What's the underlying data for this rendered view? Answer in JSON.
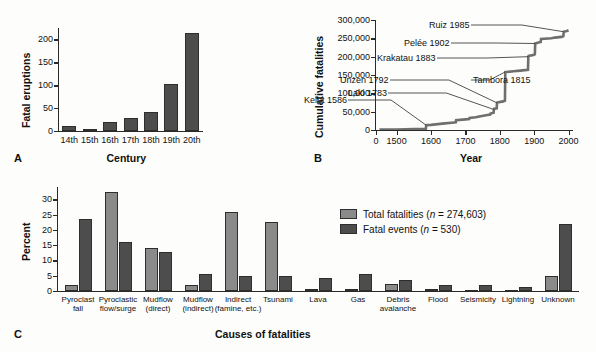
{
  "figure": {
    "panels": [
      {
        "letter": "A",
        "ylabel": "Fatal eruptions",
        "xlabel": "Century"
      },
      {
        "letter": "B",
        "ylabel": "Cumulative fatalities",
        "xlabel": "Year"
      },
      {
        "letter": "C",
        "ylabel": "Percent",
        "xlabel": "Causes of fatalities"
      }
    ]
  },
  "legend": {
    "items": [
      {
        "label_main": "Total fatalities (",
        "label_n": "n",
        "label_tail": " = 274,603)",
        "color": "#8a8a8a",
        "swatch": "light"
      },
      {
        "label_main": "Fatal events (",
        "label_n": "n",
        "label_tail": " = 530)",
        "color": "#4d4d4d",
        "swatch": "dark"
      }
    ]
  },
  "chart_data": [
    {
      "id": "panel-a",
      "type": "bar",
      "title": "",
      "xlabel": "Century",
      "ylabel": "Fatal eruptions",
      "categories": [
        "14th",
        "15th",
        "16th",
        "17th",
        "18th",
        "19th",
        "20th"
      ],
      "values": [
        11,
        5,
        19,
        29,
        41,
        102,
        213
      ],
      "yticks": [
        0,
        50,
        100,
        150,
        200
      ],
      "ylim": [
        0,
        225
      ],
      "grid": false,
      "legend": "none",
      "color": "#4d4d4d"
    },
    {
      "id": "panel-b",
      "type": "line",
      "title": "",
      "xlabel": "Year",
      "ylabel": "Cumulative fatalities",
      "yticks": [
        0,
        50000,
        100000,
        150000,
        200000,
        250000,
        300000
      ],
      "ytick_labels": [
        "0",
        "50,000",
        "100,000",
        "150,000",
        "200,000",
        "250,000",
        "300,000"
      ],
      "xticks": [
        0,
        1500,
        1600,
        1700,
        1800,
        1900,
        2000
      ],
      "xtick_labels": [
        "0",
        "1500",
        "1600",
        "1700",
        "1800",
        "1900",
        "2000"
      ],
      "xlim": [
        1440,
        2010
      ],
      "ylim": [
        0,
        300000
      ],
      "grid": false,
      "legend": "none",
      "series": [
        {
          "name": "Cumulative fatalities",
          "x": [
            1450,
            1500,
            1550,
            1585,
            1586,
            1600,
            1620,
            1640,
            1660,
            1672,
            1673,
            1700,
            1711,
            1712,
            1730,
            1740,
            1760,
            1772,
            1773,
            1782,
            1783,
            1784,
            1791,
            1792,
            1793,
            1810,
            1815,
            1816,
            1840,
            1860,
            1882,
            1883,
            1884,
            1900,
            1902,
            1903,
            1910,
            1919,
            1920,
            1950,
            1960,
            1980,
            1985,
            1986,
            1995,
            2000
          ],
          "y": [
            1000,
            1500,
            2500,
            3000,
            13000,
            14000,
            16000,
            18000,
            20000,
            21000,
            27000,
            29000,
            30000,
            33000,
            35000,
            37000,
            40000,
            42000,
            45000,
            47000,
            56000,
            58000,
            59000,
            74000,
            75000,
            78000,
            80000,
            158000,
            160000,
            162000,
            164000,
            200000,
            202000,
            205000,
            207000,
            236000,
            238000,
            240000,
            248000,
            250000,
            252000,
            254000,
            256000,
            268000,
            270000,
            272000
          ]
        }
      ],
      "annotations": [
        {
          "text": "Kelut 1586",
          "year": 1586,
          "value": 13000
        },
        {
          "text": "Laki 1783",
          "year": 1783,
          "value": 56000
        },
        {
          "text": "Unzen 1792",
          "year": 1792,
          "value": 74000
        },
        {
          "text": "Tambora 1815",
          "year": 1815,
          "value": 158000
        },
        {
          "text": "Krakatau 1883",
          "year": 1883,
          "value": 200000
        },
        {
          "text": "Pelée 1902",
          "year": 1902,
          "value": 236000
        },
        {
          "text": "Ruiz 1985",
          "year": 1985,
          "value": 268000
        }
      ]
    },
    {
      "id": "panel-c",
      "type": "bar",
      "title": "",
      "xlabel": "Causes of fatalities",
      "ylabel": "Percent",
      "categories": [
        "Pyroclast fall",
        "Pyroclastic flow/surge",
        "Mudflow (direct)",
        "Mudflow (indirect)",
        "Indirect (famine, etc.)",
        "Tsunami",
        "Lava",
        "Gas",
        "Debris avalanche",
        "Flood",
        "Seismicity",
        "Lightning",
        "Unknown"
      ],
      "category_lines": [
        [
          "Pyroclast",
          "fall"
        ],
        [
          "Pyroclastic",
          "flow/surge"
        ],
        [
          "Mudflow",
          "(direct)"
        ],
        [
          "Mudflow",
          "(indirect)"
        ],
        [
          "Indirect",
          "(famine, etc.)"
        ],
        [
          "Tsunami",
          ""
        ],
        [
          "Lava",
          ""
        ],
        [
          "Gas",
          ""
        ],
        [
          "Debris",
          "avalanche"
        ],
        [
          "Flood",
          ""
        ],
        [
          "Seismicity",
          ""
        ],
        [
          "Lightning",
          ""
        ],
        [
          "Unknown",
          ""
        ]
      ],
      "yticks": [
        0,
        5,
        10,
        15,
        20,
        25,
        30
      ],
      "ylim": [
        0,
        34
      ],
      "grid": false,
      "legend": "inside-top-right",
      "series": [
        {
          "name": "Total fatalities (n = 274,603)",
          "color": "#8a8a8a",
          "values": [
            2.0,
            32.3,
            14.2,
            1.8,
            25.8,
            22.4,
            0.5,
            0.7,
            2.2,
            0.6,
            0.4,
            0.2,
            5.0
          ]
        },
        {
          "name": "Fatal events (n = 530)",
          "color": "#4d4d4d",
          "values": [
            23.6,
            16.0,
            12.7,
            5.5,
            5.0,
            5.0,
            4.1,
            5.5,
            3.5,
            2.1,
            1.8,
            1.3,
            22.0
          ]
        }
      ]
    }
  ]
}
